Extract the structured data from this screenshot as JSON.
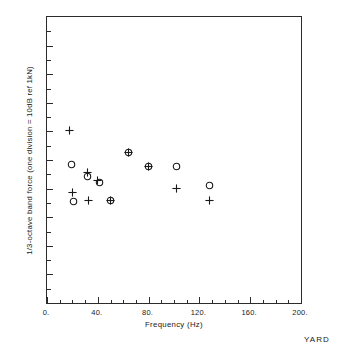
{
  "figure": {
    "corner_note": "YARD",
    "background_color": "#ffffff",
    "frame_color": "#2b2b2b",
    "marker_color": "#1a1a1a"
  },
  "chart_data": {
    "type": "scatter",
    "title": "",
    "xlabel": "Frequency  (Hz)",
    "ylabel": "1/3-octave band force (one division = 10dB ref 1kN)",
    "xlim": [
      0,
      200
    ],
    "ylim": [
      0,
      10
    ],
    "grid": false,
    "legend": null,
    "x_ticks_major": [
      "0.",
      "40.",
      "80.",
      "120.",
      "160.",
      "200."
    ],
    "x_tick_values_major": [
      0,
      40,
      80,
      120,
      160,
      200
    ],
    "x_tick_values_minor": [
      10,
      20,
      30,
      50,
      60,
      70,
      90,
      100,
      110,
      130,
      140,
      150,
      170,
      180,
      190
    ],
    "y_tick_values_major": [
      1,
      2,
      3,
      4,
      5,
      6,
      7,
      8,
      9
    ],
    "y_tick_values_minor": [
      0.5,
      1.5,
      2.5,
      3.5,
      4.5,
      5.5,
      6.5,
      7.5,
      8.5,
      9.5
    ],
    "y_tick_labels": [],
    "series": [
      {
        "name": "plus-series",
        "marker": "plus",
        "points": [
          {
            "x": 18,
            "y": 6.03
          },
          {
            "x": 32,
            "y": 4.55
          },
          {
            "x": 40,
            "y": 4.27
          },
          {
            "x": 20,
            "y": 3.86
          },
          {
            "x": 33,
            "y": 3.58
          },
          {
            "x": 50,
            "y": 3.58
          },
          {
            "x": 64,
            "y": 5.27
          },
          {
            "x": 80,
            "y": 4.79
          },
          {
            "x": 102,
            "y": 4.0
          },
          {
            "x": 128,
            "y": 3.58
          }
        ]
      },
      {
        "name": "circle-series",
        "marker": "circle",
        "points": [
          {
            "x": 19,
            "y": 4.86
          },
          {
            "x": 32,
            "y": 4.41
          },
          {
            "x": 41,
            "y": 4.2
          },
          {
            "x": 21,
            "y": 3.55
          },
          {
            "x": 50,
            "y": 3.58
          },
          {
            "x": 64,
            "y": 5.27
          },
          {
            "x": 80,
            "y": 4.79
          },
          {
            "x": 102,
            "y": 4.79
          },
          {
            "x": 128,
            "y": 4.1
          }
        ]
      }
    ]
  }
}
